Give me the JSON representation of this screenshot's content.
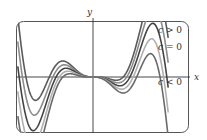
{
  "chart_data": {
    "type": "line",
    "title": "",
    "xlabel": "x",
    "ylabel": "y",
    "grid": false,
    "legend": "right (inline curve labels)",
    "xlim": [
      -3.2,
      3.2
    ],
    "ylim": [
      -2.2,
      2.0
    ],
    "function_family": "y = f(x) + c·x²",
    "series": [
      {
        "name": "c > 0 (large)",
        "c": 0.18,
        "color": "#5a5a5a"
      },
      {
        "name": "c > 0",
        "c": 0.09,
        "color": "#8c8c8c"
      },
      {
        "name": "c = 0",
        "c": 0.0,
        "color": "#444444"
      },
      {
        "name": "c < 0",
        "c": -0.09,
        "color": "#b0b0b0"
      },
      {
        "name": "c < 0 (large)",
        "c": -0.18,
        "color": "#6a6a6a"
      }
    ],
    "annotations": [
      {
        "text_var": "c",
        "text_rel": " > 0",
        "anchor": "top-right"
      },
      {
        "text_var": "c",
        "text_rel": " = 0",
        "anchor": "upper-right"
      },
      {
        "text_var": "c",
        "text_rel": " < 0",
        "anchor": "right, below x-axis"
      }
    ]
  },
  "labels": {
    "x_axis": "x",
    "y_axis": "y",
    "c_var": "c",
    "gt": " > 0",
    "eq": " = 0",
    "lt": " < 0"
  }
}
